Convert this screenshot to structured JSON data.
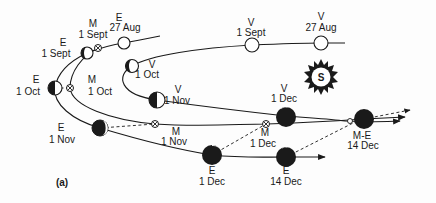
{
  "figure": {
    "panel_label": "(a)",
    "sun_label": "S",
    "colors": {
      "ink": "#1a1a1a",
      "paper": "#fdfdfd"
    }
  },
  "bodies": {
    "earth_27aug": {
      "body": "E",
      "date": "27 Aug"
    },
    "mars_1sept": {
      "body": "M",
      "date": "1 Sept"
    },
    "earth_1sept": {
      "body": "E",
      "date": "1 Sept"
    },
    "earth_1oct": {
      "body": "E",
      "date": "1 Oct"
    },
    "mars_1oct": {
      "body": "M",
      "date": "1 Oct"
    },
    "earth_1nov": {
      "body": "E",
      "date": "1 Nov"
    },
    "mars_1nov": {
      "body": "M",
      "date": "1 Nov"
    },
    "earth_1dec": {
      "body": "E",
      "date": "1 Dec"
    },
    "mars_1dec": {
      "body": "M",
      "date": "1 Dec"
    },
    "earth_14dec": {
      "body": "E",
      "date": "14 Dec"
    },
    "mars_earth_14dec": {
      "body": "M-E",
      "date": "14 Dec"
    },
    "venus_27aug": {
      "body": "V",
      "date": "27 Aug"
    },
    "venus_1sept": {
      "body": "V",
      "date": "1 Sept"
    },
    "venus_1oct": {
      "body": "V",
      "date": "1 Oct"
    },
    "venus_1nov": {
      "body": "V",
      "date": "1 Nov"
    },
    "venus_1dec": {
      "body": "V",
      "date": "1 Dec"
    }
  }
}
